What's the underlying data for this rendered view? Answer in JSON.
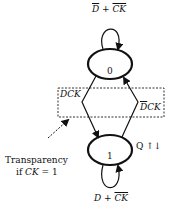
{
  "diagram": {
    "type": "state-diagram",
    "states": [
      {
        "id": "0",
        "label": "0"
      },
      {
        "id": "1",
        "label": "1",
        "annotation": "Q ↑↓"
      }
    ],
    "transitions": [
      {
        "from": "0",
        "to": "0",
        "label": {
          "a": "D",
          "plus": " + ",
          "b": "CK"
        }
      },
      {
        "from": "0",
        "to": "1",
        "label": "DCK"
      },
      {
        "from": "1",
        "to": "0",
        "label": {
          "a": "D",
          "b": "CK"
        }
      },
      {
        "from": "1",
        "to": "1",
        "label": {
          "a": "D",
          "plus": " + ",
          "b": "CK"
        }
      }
    ],
    "note": {
      "line1": "Transparency",
      "line2_prefix": "if ",
      "line2_var": "CK",
      "line2_suffix": " = 1"
    }
  }
}
